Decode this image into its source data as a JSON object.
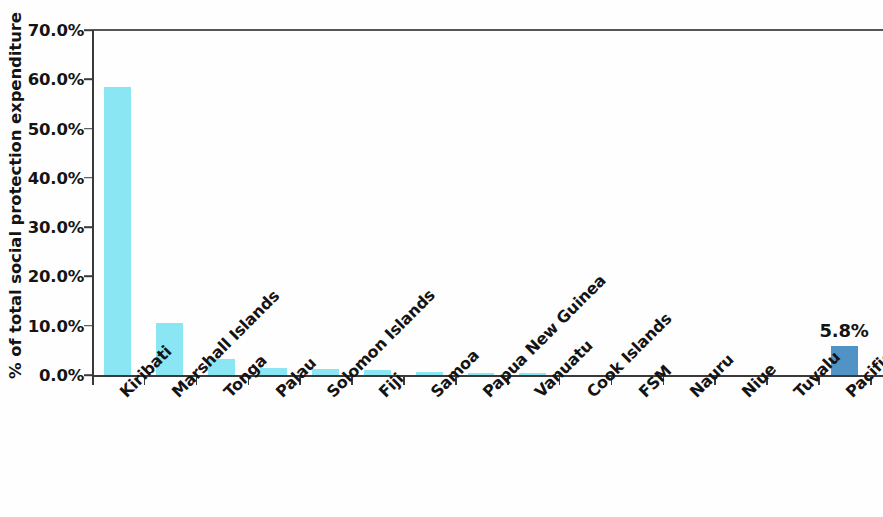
{
  "chart_data": {
    "type": "bar",
    "title": "",
    "subtitle": "",
    "xlabel": "",
    "ylabel": "% of total social protection expenditure",
    "ylim": [
      0,
      70
    ],
    "ytick_labels": [
      "0.0%",
      "10.0%",
      "20.0%",
      "30.0%",
      "40.0%",
      "50.0%",
      "60.0%",
      "70.0%"
    ],
    "ytick_values": [
      0,
      10,
      20,
      30,
      40,
      50,
      60,
      70
    ],
    "grid": false,
    "legend": "none",
    "value_unit": "percent",
    "categories": [
      "Kiribati",
      "Marshall Islands",
      "Tonga",
      "Palau",
      "Solomon Islands",
      "Fiji",
      "Samoa",
      "Papua New Guinea",
      "Vanuatu",
      "Cook Islands",
      "FSM",
      "Nauru",
      "Niue",
      "Tuvalu",
      "Pacific Average"
    ],
    "values": [
      58.4,
      10.5,
      3.3,
      1.5,
      1.2,
      1.1,
      0.7,
      0.5,
      0.5,
      0.0,
      0.0,
      0.0,
      0.0,
      0.0,
      5.8
    ],
    "bar_colors": [
      "#8ae6f3",
      "#8ae6f3",
      "#8ae6f3",
      "#8ae6f3",
      "#8ae6f3",
      "#8ae6f3",
      "#8ae6f3",
      "#8ae6f3",
      "#8ae6f3",
      "#8ae6f3",
      "#8ae6f3",
      "#8ae6f3",
      "#8ae6f3",
      "#8ae6f3",
      "#5293c6"
    ],
    "data_labels": [
      "",
      "",
      "",
      "",
      "",
      "",
      "",
      "",
      "",
      "",
      "",
      "",
      "",
      "",
      "5.8%"
    ],
    "colors": {
      "bar_default": "#8ae6f3",
      "bar_accent": "#5293c6",
      "axis": "#3a3a3a",
      "text": "#141414",
      "background": "#fefefe"
    }
  }
}
